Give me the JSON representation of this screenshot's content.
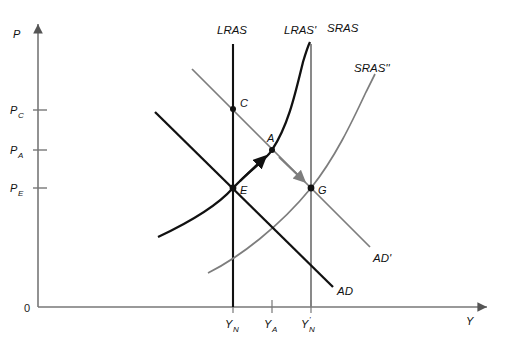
{
  "figure": {
    "type": "economics-diagram",
    "background_color": "#ffffff",
    "black": "#111111",
    "gray": "#7d7d7d"
  },
  "axes": {
    "y_axis_label": "P",
    "x_axis_label": "Y",
    "origin_label": "0",
    "y_ticks": [
      {
        "label": "P",
        "sub": "C",
        "y": 110
      },
      {
        "label": "P",
        "sub": "A",
        "y": 150
      },
      {
        "label": "P",
        "sub": "E",
        "y": 188
      }
    ],
    "x_ticks": [
      {
        "label": "Y",
        "sub": "N",
        "prime": "",
        "x": 233
      },
      {
        "label": "Y",
        "sub": "A",
        "prime": "",
        "x": 272
      },
      {
        "label": "Y",
        "sub": "N",
        "prime": "'",
        "x": 311
      }
    ]
  },
  "curves": [
    {
      "name": "LRAS",
      "label": "LRAS",
      "color": "#111111",
      "style": "vertical-line",
      "x": 233
    },
    {
      "name": "LRAS-prime",
      "label": "LRAS'",
      "color": "#7d7d7d",
      "style": "vertical-line",
      "x": 311
    },
    {
      "name": "SRAS",
      "label": "SRAS",
      "color": "#111111",
      "style": "upward-curve"
    },
    {
      "name": "SRAS-double-prime",
      "label": "SRAS''",
      "color": "#7d7d7d",
      "style": "upward-curve"
    },
    {
      "name": "AD",
      "label": "AD",
      "color": "#111111",
      "style": "downward-line"
    },
    {
      "name": "AD-prime",
      "label": "AD'",
      "color": "#7d7d7d",
      "style": "downward-line"
    }
  ],
  "points": [
    {
      "name": "C",
      "label": "C",
      "x": 233,
      "y": 109
    },
    {
      "name": "A",
      "label": "A",
      "x": 272,
      "y": 150
    },
    {
      "name": "E",
      "label": "E",
      "x": 233,
      "y": 188
    },
    {
      "name": "G",
      "label": "G",
      "x": 311,
      "y": 188
    }
  ],
  "arrows": [
    {
      "name": "arrow-e-to-a",
      "color": "#111111",
      "from": "E",
      "to": "A"
    },
    {
      "name": "arrow-a-to-g",
      "color": "#7d7d7d",
      "from": "A",
      "to": "G"
    }
  ],
  "curve_labels": {
    "lras": "LRAS",
    "lras_prime": "LRAS'",
    "sras": "SRAS",
    "sras_double_prime": "SRAS''",
    "ad": "AD",
    "ad_prime": "AD'"
  }
}
